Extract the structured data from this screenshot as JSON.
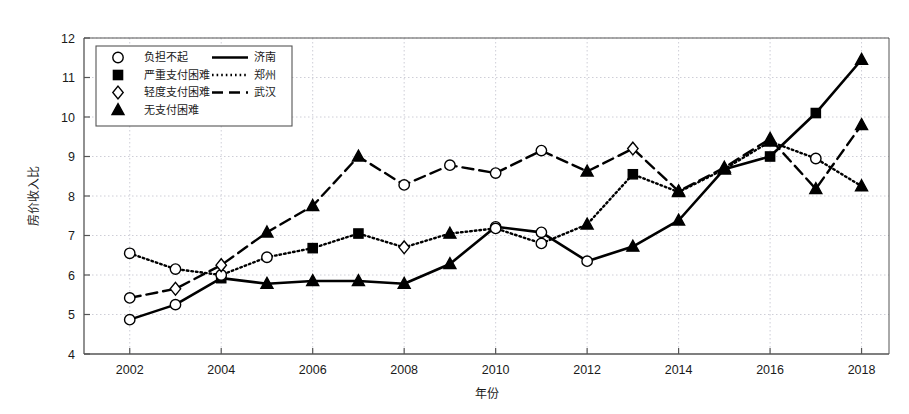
{
  "chart_data": {
    "type": "line",
    "title": "",
    "xlabel": "年份",
    "ylabel": "房价收入比",
    "xlim": [
      2001,
      2018.6
    ],
    "ylim": [
      4,
      12
    ],
    "xticks": [
      2002,
      2004,
      2006,
      2008,
      2010,
      2012,
      2014,
      2016,
      2018
    ],
    "yticks": [
      4,
      5,
      6,
      7,
      8,
      9,
      10,
      11,
      12
    ],
    "grid": true,
    "legend_position": "upper-left",
    "x": [
      2002,
      2003,
      2004,
      2005,
      2006,
      2007,
      2008,
      2009,
      2010,
      2011,
      2012,
      2013,
      2014,
      2015,
      2016,
      2017,
      2018
    ],
    "series": [
      {
        "name": "济南",
        "line_style": "solid",
        "values": [
          4.87,
          5.25,
          5.92,
          5.78,
          5.85,
          5.85,
          5.78,
          6.28,
          7.22,
          7.08,
          6.35,
          6.72,
          7.38,
          8.68,
          9.0,
          10.1,
          11.45
        ],
        "markers": [
          "circle",
          "circle",
          "square",
          "triangle",
          "triangle",
          "triangle",
          "triangle",
          "triangle",
          "circle",
          "circle",
          "circle",
          "triangle",
          "triangle",
          "triangle",
          "square",
          "square",
          "triangle"
        ]
      },
      {
        "name": "郑州",
        "line_style": "dotted",
        "values": [
          6.55,
          6.15,
          6.0,
          6.45,
          6.68,
          7.05,
          6.7,
          7.05,
          7.18,
          6.8,
          7.28,
          8.55,
          8.1,
          8.68,
          9.38,
          8.95,
          8.25
        ],
        "markers": [
          "circle",
          "circle",
          "circle",
          "circle",
          "square",
          "square",
          "diamond",
          "triangle",
          "circle",
          "circle",
          "triangle",
          "square",
          "triangle",
          "triangle",
          "triangle",
          "circle",
          "triangle"
        ]
      },
      {
        "name": "武汉",
        "line_style": "dashed",
        "values": [
          5.42,
          5.65,
          6.25,
          7.08,
          7.75,
          9.0,
          8.28,
          8.78,
          8.58,
          9.15,
          8.62,
          9.2,
          8.12,
          8.72,
          9.45,
          8.18,
          9.8
        ],
        "markers": [
          "circle",
          "diamond",
          "diamond",
          "triangle",
          "triangle",
          "triangle",
          "circle",
          "circle",
          "circle",
          "circle",
          "triangle",
          "diamond",
          "triangle",
          "triangle",
          "triangle",
          "triangle",
          "triangle"
        ]
      }
    ],
    "marker_legend": [
      {
        "marker": "circle",
        "label": "负担不起"
      },
      {
        "marker": "square",
        "label": "严重支付困难"
      },
      {
        "marker": "diamond",
        "label": "轻度支付困难"
      },
      {
        "marker": "triangle",
        "label": "无支付困难"
      }
    ],
    "line_legend": [
      {
        "line_style": "solid",
        "label": "济南"
      },
      {
        "line_style": "dotted",
        "label": "郑州"
      },
      {
        "line_style": "dashed",
        "label": "武汉"
      }
    ],
    "colors": {
      "line": "#000000",
      "grid": "#c8c8d2",
      "axis": "#555555",
      "text": "#1a1a1a"
    }
  }
}
